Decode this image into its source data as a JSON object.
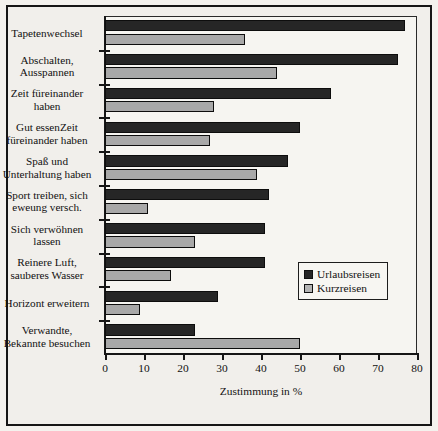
{
  "chart_data": {
    "type": "bar",
    "orientation": "horizontal",
    "title": "",
    "xlabel": "Zustimmung in %",
    "ylabel": "",
    "xlim": [
      0,
      80
    ],
    "xticks": [
      0,
      10,
      20,
      30,
      40,
      50,
      60,
      70,
      80
    ],
    "grid": false,
    "legend_position": "middle-right",
    "categories": [
      "Tapetenwechsel",
      "Abschalten,\nAusspannen",
      "Zeit füreinander\nhaben",
      "Gut essenZeit\nfüreinander haben",
      "Spaß und\nUnterhaltung haben",
      "Sport treiben, sich\neweung versch.",
      "Sich verwöhnen\nlassen",
      "Reinere Luft,\nsauberes Wasser",
      "Horizont erweitern",
      "Verwandte,\nBekannte besuchen"
    ],
    "series": [
      {
        "name": "Urlaubsreisen",
        "color": "#262626",
        "values": [
          77,
          75,
          58,
          50,
          47,
          42,
          41,
          41,
          29,
          23
        ]
      },
      {
        "name": "Kurzreisen",
        "color": "#a8a8a8",
        "values": [
          36,
          44,
          28,
          27,
          39,
          11,
          23,
          17,
          9,
          50
        ]
      }
    ]
  },
  "legend": {
    "items": [
      {
        "label": "Urlaubsreisen",
        "swatch": "dark-square-icon"
      },
      {
        "label": "Kurzreisen",
        "swatch": "gray-square-icon"
      }
    ]
  }
}
